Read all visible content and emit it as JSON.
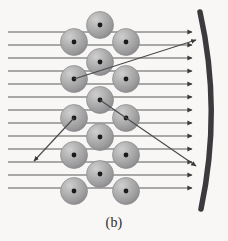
{
  "figure": {
    "caption": "(b)",
    "width": 228,
    "height": 241,
    "background_color": "#f8f7f5"
  },
  "colors": {
    "background": "#f8f7f5",
    "ray": "#5a5a5c",
    "ray_arrowhead": "#3a3a3c",
    "scattered_ray": "#4a4a4c",
    "sphere_fill_light": "#c9c9c9",
    "sphere_fill_mid": "#a9a9a9",
    "sphere_fill_dark": "#8d8d8f",
    "sphere_edge": "#8a8a8c",
    "nucleus_dot": "#1a1a1a",
    "arc": "#3b3b3d",
    "caption_text": "#2b2b2b"
  },
  "geometry": {
    "ray_start_x": 8,
    "ray_end_x": 192,
    "sphere_radius": 13.5,
    "nucleus_radius": 2.4,
    "arc_stroke_width": 5.5
  },
  "chart_data": {
    "type": "scatter",
    "xlabel": "",
    "ylabel": "",
    "xlim": [
      0,
      228
    ],
    "ylim": [
      0,
      241
    ],
    "grid": false,
    "legend": "none",
    "incident_rays": {
      "name": "incident parallel rays",
      "count": 13,
      "direction": "left-to-right horizontal",
      "x_start": 8,
      "x_end": 192,
      "y_values": [
        32,
        45,
        58,
        71,
        84,
        97,
        110,
        123,
        136,
        149,
        162,
        175,
        188
      ],
      "arrowhead": "right-pointing triangle at reflector"
    },
    "spheres": {
      "name": "scattering spheres (atoms)",
      "radius": 13.5,
      "lattice": "hexagonal close-packed, 3 columns offset in rows",
      "centers": [
        {
          "x": 100,
          "y": 25
        },
        {
          "x": 74,
          "y": 42
        },
        {
          "x": 126,
          "y": 42
        },
        {
          "x": 100,
          "y": 62
        },
        {
          "x": 74,
          "y": 79
        },
        {
          "x": 126,
          "y": 79
        },
        {
          "x": 100,
          "y": 100
        },
        {
          "x": 74,
          "y": 118
        },
        {
          "x": 126,
          "y": 118
        },
        {
          "x": 100,
          "y": 137
        },
        {
          "x": 74,
          "y": 155
        },
        {
          "x": 126,
          "y": 155
        },
        {
          "x": 100,
          "y": 174
        },
        {
          "x": 74,
          "y": 191
        },
        {
          "x": 126,
          "y": 191
        }
      ]
    },
    "scattered_rays": {
      "name": "scattered rays",
      "count": 3,
      "segments": [
        {
          "id": "upward-scatter",
          "x1": 74,
          "y1": 79,
          "x2": 196,
          "y2": 40,
          "arrow_at": "end",
          "label": "scattered upward to reflector"
        },
        {
          "id": "downward-scatter",
          "x1": 100,
          "y1": 100,
          "x2": 196,
          "y2": 166,
          "arrow_at": "end",
          "label": "scattered downward to reflector"
        },
        {
          "id": "backward-scatter",
          "x1": 74,
          "y1": 118,
          "x2": 34,
          "y2": 161,
          "arrow_at": "end",
          "label": "back-scattered out of medium"
        }
      ]
    },
    "reflector_arc": {
      "name": "curved reflector",
      "type": "quadratic-bezier",
      "start": {
        "x": 200,
        "y": 12
      },
      "control": {
        "x": 222,
        "y": 110
      },
      "end": {
        "x": 201,
        "y": 209
      },
      "stroke_width": 5.5,
      "color": "#3b3b3d"
    }
  }
}
